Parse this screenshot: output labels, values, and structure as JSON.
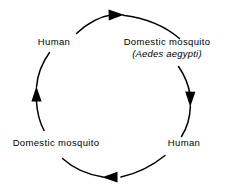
{
  "diagram": {
    "direction": "clockwise",
    "stroke_color": "#000000",
    "background_color": "#ffffff",
    "nodes": [
      {
        "id": "human-top",
        "position": "upper-left",
        "label": "Human"
      },
      {
        "id": "mosquito-top",
        "position": "upper-right",
        "label": "Domestic mosquito",
        "scientific_name": "(Aedes aegypti)"
      },
      {
        "id": "human-bottom",
        "position": "lower-right",
        "label": "Human"
      },
      {
        "id": "mosquito-bottom",
        "position": "lower-left",
        "label": "Domestic mosquito"
      }
    ],
    "arrows": [
      {
        "id": "arrow-top",
        "from": "human-top",
        "to": "mosquito-top",
        "points": "right"
      },
      {
        "id": "arrow-right",
        "from": "mosquito-top",
        "to": "human-bottom",
        "points": "down"
      },
      {
        "id": "arrow-bottom",
        "from": "human-bottom",
        "to": "mosquito-bottom",
        "points": "left"
      },
      {
        "id": "arrow-left",
        "from": "mosquito-bottom",
        "to": "human-top",
        "points": "up"
      }
    ]
  }
}
